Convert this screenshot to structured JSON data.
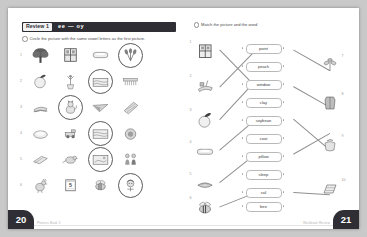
{
  "book": {
    "header": {
      "review_label": "Review 1",
      "phonics": "ee — oy",
      "bar_color": "#2e2e34"
    },
    "left_page": {
      "number": "20",
      "footer": "Phonics Book 3",
      "instruction": "Circle the picture with the same vowel letters as the first picture.",
      "rows": [
        {
          "number": "1",
          "selected_index": 3,
          "cells": [
            "tree",
            "window",
            "soap-bar",
            "wheat-sheaf"
          ]
        },
        {
          "number": "2",
          "selected_index": 2,
          "cells": [
            "peach",
            "flower-vase",
            "pool",
            "comb"
          ]
        },
        {
          "number": "3",
          "selected_index": 1,
          "cells": [
            "sled",
            "cat",
            "paper-plane",
            "blanket"
          ]
        },
        {
          "number": "4",
          "selected_index": 2,
          "cells": [
            "soap-dish",
            "toy-truck",
            "pool",
            "coil"
          ]
        },
        {
          "number": "5",
          "selected_index": 2,
          "cells": [
            "books",
            "bird",
            "window-scene",
            "boy-and-girl"
          ]
        },
        {
          "number": "6",
          "selected_index": 3,
          "cells": [
            "rooster",
            "calendar-five",
            "bee",
            "boy-head"
          ]
        }
      ]
    },
    "right_page": {
      "number": "21",
      "footer": "Workbook  Review",
      "instruction": "Match the picture and the word",
      "left_items": [
        {
          "number": "1",
          "picture": "window"
        },
        {
          "number": "2",
          "picture": "sled"
        },
        {
          "number": "3",
          "picture": "peach"
        },
        {
          "number": "4",
          "picture": "soap-bar"
        },
        {
          "number": "5",
          "picture": "pillow"
        },
        {
          "number": "6",
          "picture": "bee"
        }
      ],
      "words": [
        "point",
        "peach",
        "window",
        "clay",
        "soybean",
        "coat",
        "pillow",
        "sleep",
        "rail",
        "bee"
      ],
      "right_items": [
        {
          "number": "7",
          "picture": "soybean-plant"
        },
        {
          "number": "8",
          "picture": "coat"
        },
        {
          "number": "9",
          "picture": "clay-pot"
        },
        {
          "number": "10",
          "picture": "rail-cart"
        }
      ]
    }
  }
}
